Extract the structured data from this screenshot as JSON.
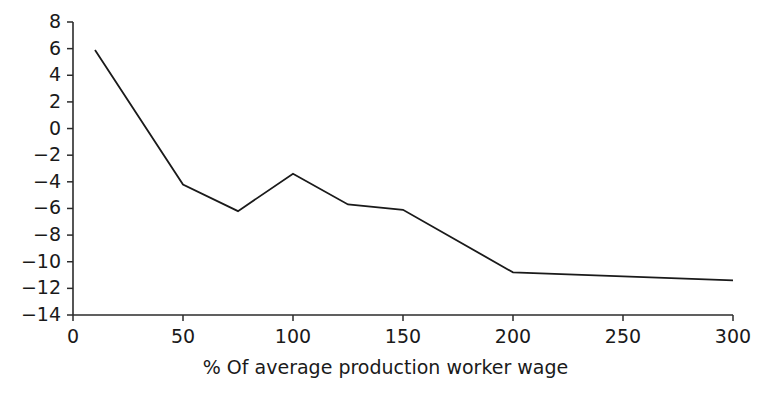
{
  "chart_data": {
    "type": "line",
    "title": "",
    "subtitle": "",
    "xlabel": "% Of average production worker wage",
    "ylabel": "",
    "xlim": [
      0,
      300
    ],
    "ylim": [
      -14,
      8
    ],
    "xticks": [
      0,
      50,
      100,
      150,
      200,
      250,
      300
    ],
    "xtick_labels": [
      "0",
      "50",
      "100",
      "150",
      "200",
      "250",
      "300"
    ],
    "yticks": [
      8,
      6,
      4,
      2,
      0,
      -2,
      -4,
      -6,
      -8,
      -10,
      -12,
      -14
    ],
    "ytick_labels": [
      "8",
      "6",
      "4",
      "2",
      "0",
      "−2",
      "−4",
      "−6",
      "−8",
      "−10",
      "−12",
      "−14"
    ],
    "grid": false,
    "legend": null,
    "series": [
      {
        "name": "",
        "color": "#1a1a1a",
        "x": [
          10,
          50,
          75,
          100,
          125,
          150,
          200,
          300
        ],
        "values": [
          5.9,
          -4.2,
          -6.2,
          -3.4,
          -5.7,
          -6.1,
          -10.8,
          -11.4
        ]
      }
    ]
  },
  "axis": {
    "x_title": "% Of average production worker wage"
  }
}
